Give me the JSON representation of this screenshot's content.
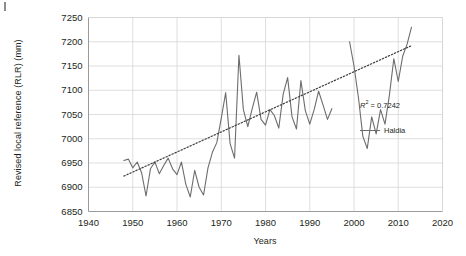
{
  "figure": {
    "corner_mark": "crop-mark"
  },
  "chart_data": {
    "type": "line",
    "title": "",
    "xlabel": "Years",
    "ylabel": "Revised local reference (RLR) (mm)",
    "xlim": [
      1940,
      2020
    ],
    "ylim": [
      6850,
      7250
    ],
    "xticks": [
      1940,
      1950,
      1960,
      1970,
      1980,
      1990,
      2000,
      2010,
      2020
    ],
    "yticks": [
      6850,
      6900,
      6950,
      7000,
      7050,
      7100,
      7150,
      7200,
      7250
    ],
    "grid": true,
    "legend_position": "inside-right",
    "annotations": [
      {
        "name": "r-squared",
        "text": "R2 = 0.7242",
        "display": "R² = 0.7242"
      }
    ],
    "series": [
      {
        "name": "Haldia",
        "color": "#6d6d6d",
        "style": "solid",
        "x": [
          1948,
          1949,
          1950,
          1951,
          1952,
          1953,
          1954,
          1955,
          1956,
          1957,
          1958,
          1959,
          1960,
          1961,
          1962,
          1963,
          1964,
          1965,
          1966,
          1967,
          1968,
          1969,
          1970,
          1971,
          1972,
          1973,
          1974,
          1975,
          1976,
          1977,
          1978,
          1979,
          1980,
          1981,
          1982,
          1983,
          1984,
          1985,
          1986,
          1987,
          1988,
          1989,
          1990,
          1991,
          1992,
          1993,
          1994,
          1995
        ],
        "values": [
          6955,
          6958,
          6940,
          6952,
          6930,
          6882,
          6938,
          6952,
          6928,
          6945,
          6960,
          6938,
          6926,
          6952,
          6906,
          6880,
          6935,
          6900,
          6884,
          6940,
          6972,
          6992,
          7042,
          7095,
          6990,
          6960,
          7172,
          7060,
          7025,
          7062,
          7096,
          7040,
          7028,
          7060,
          7048,
          7022,
          7092,
          7126,
          7045,
          7020,
          7120,
          7058,
          7030,
          7060,
          7098,
          7070,
          7040,
          7062
        ]
      },
      {
        "name": "Haldia-2",
        "color": "#6d6d6d",
        "style": "solid",
        "x": [
          1999,
          2000,
          2001,
          2002,
          2003,
          2004,
          2005,
          2006,
          2007,
          2008,
          2009,
          2010,
          2011,
          2012,
          2013
        ],
        "values": [
          7200,
          7150,
          7085,
          7005,
          6980,
          7045,
          7010,
          7060,
          7030,
          7090,
          7165,
          7118,
          7170,
          7195,
          7230
        ]
      },
      {
        "name": "Trendline",
        "color": "#3f3f3f",
        "style": "dotted",
        "x": [
          1948,
          2013
        ],
        "values": [
          6923,
          7192
        ]
      }
    ]
  },
  "legend": {
    "r2_label": "R² = 0.7242",
    "series_label": "Haldia"
  }
}
